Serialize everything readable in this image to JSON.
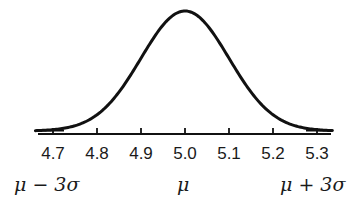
{
  "chart_data": {
    "type": "line",
    "title": "",
    "subtitle": "",
    "distribution": {
      "name": "normal",
      "mean": 5.0,
      "std": 0.1
    },
    "xlabel": "",
    "ylabel": "",
    "xlim": [
      4.66,
      5.33
    ],
    "x_ticks": [
      4.7,
      4.8,
      4.9,
      5.0,
      5.1,
      5.2,
      5.3
    ],
    "x_tick_labels": [
      "4.7",
      "4.8",
      "4.9",
      "5.0",
      "5.1",
      "5.2",
      "5.3"
    ],
    "annotations": [
      {
        "x": 4.7,
        "text": "μ − 3σ"
      },
      {
        "x": 5.0,
        "text": "μ"
      },
      {
        "x": 5.3,
        "text": "μ + 3σ"
      }
    ],
    "series": [
      {
        "name": "density",
        "x": [
          4.66,
          4.7,
          4.75,
          4.8,
          4.85,
          4.9,
          4.95,
          5.0,
          5.05,
          5.1,
          5.15,
          5.2,
          5.25,
          5.3,
          5.33
        ],
        "y": [
          0.0034,
          0.0111,
          0.0438,
          0.1353,
          0.3247,
          0.6065,
          0.8825,
          1.0,
          0.8825,
          0.6065,
          0.3247,
          0.1353,
          0.0438,
          0.0111,
          0.0043
        ]
      }
    ],
    "grid": false,
    "legend": null,
    "y_axis_visible": false
  },
  "labels": {
    "ticks": [
      "4.7",
      "4.8",
      "4.9",
      "5.0",
      "5.1",
      "5.2",
      "5.3"
    ],
    "mu_minus": "μ − 3σ",
    "mu": "μ",
    "mu_plus": "μ + 3σ"
  }
}
